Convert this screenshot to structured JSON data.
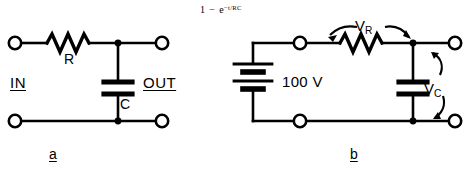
{
  "figure": {
    "type": "rc-circuit-diagram",
    "background_color": "#ffffff",
    "line_color": "#000000",
    "formula": {
      "full_text": "1 - e^(-t/RC)",
      "lead": "1",
      "minus": "−",
      "base": "e",
      "exponent": "−t/RC"
    },
    "panels": [
      {
        "id": "a",
        "caption": "a",
        "description": "RC low-pass network with input and output terminals",
        "labels": {
          "resistor": "R",
          "capacitor": "C",
          "input_port": "IN",
          "output_port": "OUT"
        }
      },
      {
        "id": "b",
        "caption": "b",
        "description": "Battery driving series resistor and capacitor with voltage drop annotations",
        "labels": {
          "source": "100 V",
          "resistor_voltage": "V",
          "resistor_voltage_sub": "R",
          "capacitor_voltage": "V",
          "capacitor_voltage_sub": "C"
        }
      }
    ]
  }
}
